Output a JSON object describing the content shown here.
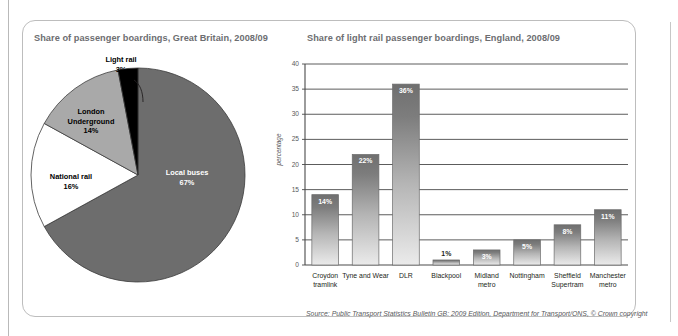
{
  "figure": {
    "source_prefix": "Source: Public Transport Statistics Bulletin GB: 2009 Edition, ",
    "source_italic": "Department for Transport/ONS",
    "source_suffix": ", © ",
    "source_copyright": "Crown copyright",
    "colors": {
      "dark_gray": "#6d6d6d",
      "mid_gray": "#8f8f8f",
      "light_gray": "#a9a9a9",
      "black": "#000000",
      "white": "#ffffff",
      "title_gray": "#6d6e71",
      "axis_gray": "#58595b",
      "frame_gray": "#bdbdbd"
    }
  },
  "chart_data": [
    {
      "type": "pie",
      "title": "Share of passenger boardings, Great Britain, 2008/09",
      "xlabel": "",
      "ylabel": "",
      "units": "percentage",
      "categories": [
        "Local buses",
        "National rail",
        "London Underground",
        "Light rail"
      ],
      "values": [
        67,
        16,
        14,
        3
      ],
      "labels": [
        "67%",
        "16%",
        "14%",
        "3%"
      ],
      "slice_colors": [
        "#6d6d6d",
        "#ffffff",
        "#a9a9a9",
        "#000000"
      ],
      "legend": "none",
      "slices": [
        {
          "name": "Local buses",
          "value": 67,
          "label": "67%",
          "color": "#6d6d6d",
          "label_text_color": "#ffffff",
          "label_placement": "inside"
        },
        {
          "name": "National rail",
          "value": 16,
          "label": "16%",
          "color": "#ffffff",
          "label_text_color": "#000000",
          "label_placement": "inside"
        },
        {
          "name": "London Underground",
          "value": 14,
          "label": "14%",
          "color": "#a9a9a9",
          "label_text_color": "#000000",
          "label_placement": "inside"
        },
        {
          "name": "Light rail",
          "value": 3,
          "label": "3%",
          "color": "#000000",
          "label_text_color": "#000000",
          "label_placement": "outside-leader"
        }
      ]
    },
    {
      "type": "bar",
      "title": "Share of light rail passenger boardings, England, 2008/09",
      "xlabel": "",
      "ylabel": "percentage",
      "categories": [
        "Croydon tramlink",
        "Tyne and Wear",
        "DLR",
        "Blackpool",
        "Midland metro",
        "Nottingham",
        "Sheffield Supertram",
        "Manchester metro"
      ],
      "category_lines": [
        [
          "Croydon",
          "tramlink"
        ],
        [
          "Tyne and Wear",
          ""
        ],
        [
          "DLR",
          ""
        ],
        [
          "Blackpool",
          ""
        ],
        [
          "Midland",
          "metro"
        ],
        [
          "Nottingham",
          ""
        ],
        [
          "Sheffield",
          "Supertram"
        ],
        [
          "Manchester",
          "metro"
        ]
      ],
      "values": [
        14,
        22,
        36,
        1,
        3,
        5,
        8,
        11
      ],
      "value_labels": [
        "14%",
        "22%",
        "36%",
        "1%",
        "3%",
        "5%",
        "8%",
        "11%"
      ],
      "label_inside": [
        true,
        true,
        true,
        false,
        true,
        true,
        true,
        true
      ],
      "ylim": [
        0,
        40
      ],
      "yticks": [
        0,
        5,
        10,
        15,
        20,
        25,
        30,
        35,
        40
      ],
      "ytick_labels": [
        "0",
        "5",
        "10",
        "15",
        "20",
        "25",
        "30",
        "35",
        "40"
      ],
      "grid": true,
      "grid_axis": "y",
      "bar_fill": "vertical-gradient-dark-to-light",
      "bar_color_top": "#6d6d6d",
      "bar_color_bottom": "#e6e6e6",
      "legend": "none"
    }
  ]
}
